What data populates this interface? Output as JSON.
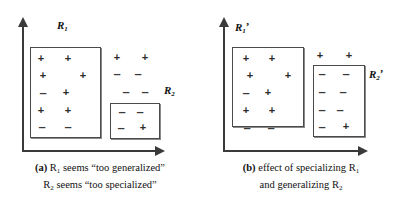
{
  "figure": {
    "background_color": "#ffffff",
    "line_color": "#3a3a3a",
    "box_border_color": "#4a4a4a"
  },
  "panels": [
    {
      "id": "a",
      "caption_tag": "(a)",
      "caption_line1_pre": "R",
      "caption_line1_sub": "1",
      "caption_line1_post": " seems “too generalized”",
      "caption_line2_pre": "R",
      "caption_line2_sub": "2",
      "caption_line2_post": " seems “too specialized”",
      "regions": [
        {
          "name": "R1",
          "label_base": "R",
          "label_sub": "1",
          "label_prime": "",
          "x": 30,
          "y": 47,
          "w": 71,
          "h": 91,
          "label_x": 57,
          "label_y": 26
        },
        {
          "name": "R2",
          "label_base": "R",
          "label_sub": "2",
          "label_prime": "",
          "x": 110,
          "y": 103,
          "w": 50,
          "h": 36,
          "label_x": 164,
          "label_y": 90
        }
      ],
      "marks": [
        {
          "sym": "+",
          "x": 41,
          "y": 58
        },
        {
          "sym": "+",
          "x": 68,
          "y": 58
        },
        {
          "sym": "+",
          "x": 43,
          "y": 75
        },
        {
          "sym": "+",
          "x": 83,
          "y": 75
        },
        {
          "sym": "–",
          "x": 43,
          "y": 93
        },
        {
          "sym": "+",
          "x": 66,
          "y": 92
        },
        {
          "sym": "+",
          "x": 41,
          "y": 110
        },
        {
          "sym": "+",
          "x": 68,
          "y": 110
        },
        {
          "sym": "–",
          "x": 42,
          "y": 127
        },
        {
          "sym": "–",
          "x": 68,
          "y": 127
        },
        {
          "sym": "+",
          "x": 117,
          "y": 57
        },
        {
          "sym": "+",
          "x": 145,
          "y": 57
        },
        {
          "sym": "–",
          "x": 117,
          "y": 74
        },
        {
          "sym": "–",
          "x": 138,
          "y": 74
        },
        {
          "sym": "–",
          "x": 126,
          "y": 92
        },
        {
          "sym": "–",
          "x": 145,
          "y": 92
        },
        {
          "sym": "–",
          "x": 122,
          "y": 112
        },
        {
          "sym": "–",
          "x": 140,
          "y": 112
        },
        {
          "sym": "–",
          "x": 121,
          "y": 128
        },
        {
          "sym": "+",
          "x": 143,
          "y": 127
        }
      ]
    },
    {
      "id": "b",
      "caption_tag": "(b)",
      "caption_line1_pre": "effect of specializing R",
      "caption_line1_sub": "1",
      "caption_line1_post": "",
      "caption_line2_pre": "and generalizing R",
      "caption_line2_sub": "2",
      "caption_line2_post": "",
      "regions": [
        {
          "name": "R1prime",
          "label_base": "R",
          "label_sub": "1",
          "label_prime": "’",
          "x": 31,
          "y": 47,
          "w": 72,
          "h": 80,
          "label_x": 34,
          "label_y": 27
        },
        {
          "name": "R2prime",
          "label_base": "R",
          "label_sub": "2",
          "label_prime": "’",
          "x": 112,
          "y": 65,
          "w": 52,
          "h": 72,
          "label_x": 168,
          "label_y": 74
        }
      ],
      "marks": [
        {
          "sym": "+",
          "x": 45,
          "y": 58
        },
        {
          "sym": "+",
          "x": 71,
          "y": 58
        },
        {
          "sym": "+",
          "x": 49,
          "y": 75
        },
        {
          "sym": "+",
          "x": 87,
          "y": 75
        },
        {
          "sym": "–",
          "x": 45,
          "y": 93
        },
        {
          "sym": "+",
          "x": 67,
          "y": 92
        },
        {
          "sym": "+",
          "x": 45,
          "y": 110
        },
        {
          "sym": "+",
          "x": 71,
          "y": 110
        },
        {
          "sym": "–",
          "x": 46,
          "y": 128
        },
        {
          "sym": "–",
          "x": 70,
          "y": 128
        },
        {
          "sym": "+",
          "x": 119,
          "y": 55
        },
        {
          "sym": "+",
          "x": 148,
          "y": 55
        },
        {
          "sym": "–",
          "x": 121,
          "y": 74
        },
        {
          "sym": "–",
          "x": 145,
          "y": 74
        },
        {
          "sym": "–",
          "x": 121,
          "y": 92
        },
        {
          "sym": "–",
          "x": 142,
          "y": 92
        },
        {
          "sym": "–",
          "x": 121,
          "y": 110
        },
        {
          "sym": "–",
          "x": 139,
          "y": 110
        },
        {
          "sym": "–",
          "x": 121,
          "y": 127
        },
        {
          "sym": "+",
          "x": 145,
          "y": 126
        }
      ],
      "axes": {}
    }
  ],
  "axes": {
    "v_axis_x": 22,
    "v_axis_top": 22,
    "v_axis_bottom": 151,
    "h_axis_y": 150,
    "h_axis_left": 22,
    "h_axis_right": 158
  }
}
